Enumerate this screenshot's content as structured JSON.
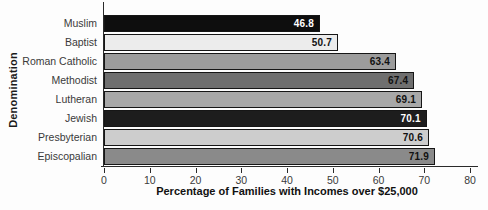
{
  "chart_data": {
    "type": "bar",
    "orientation": "horizontal",
    "title": "",
    "xlabel": "Percentage of Families with Incomes over $25,000",
    "ylabel": "Denomination",
    "xlim": [
      0,
      80
    ],
    "xticks": [
      "0",
      "10",
      "20",
      "30",
      "40",
      "50",
      "60",
      "70",
      "80"
    ],
    "grid": false,
    "legend": null,
    "categories": [
      "Muslim",
      "Baptist",
      "Roman Catholic",
      "Methodist",
      "Lutheran",
      "Jewish",
      "Presbyterian",
      "Episcopalian"
    ],
    "values": [
      46.8,
      50.7,
      63.4,
      67.4,
      69.1,
      70.1,
      70.6,
      71.9
    ],
    "value_labels": [
      "46.8",
      "50.7",
      "63.4",
      "67.4",
      "69.1",
      "70.1",
      "70.6",
      "71.9"
    ],
    "bar_colors": [
      "#0e0e0e",
      "#ececec",
      "#9c9c9c",
      "#6f6f6f",
      "#a8a8a8",
      "#1d1d1d",
      "#cdcdcd",
      "#8a8a8a"
    ],
    "value_label_colors": [
      "#ffffff",
      "#111111",
      "#111111",
      "#111111",
      "#111111",
      "#ffffff",
      "#111111",
      "#111111"
    ],
    "bar_border_color": "#161616"
  }
}
